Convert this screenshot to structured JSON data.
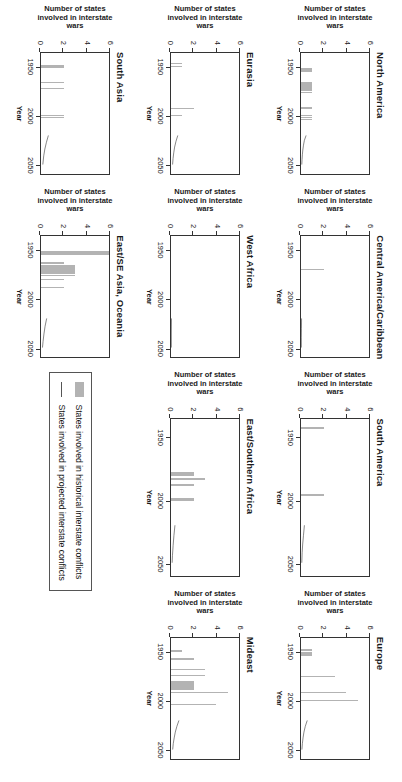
{
  "figure": {
    "rotation_degrees": 90,
    "panel_count": 11,
    "axis_titles": {
      "y": "Number of states involved in interstate wars",
      "x": "Year"
    },
    "y_ticks": [
      "0",
      "2",
      "4",
      "6"
    ],
    "x_ticks": [
      "1950",
      "2000",
      "2050"
    ],
    "colors": {
      "historical_bar": "#b3b3b3",
      "projected_line": "#555555",
      "axis": "#333333",
      "background": "#ffffff"
    }
  },
  "legend": {
    "items": [
      {
        "marker": "bar-swatch",
        "label": "States involved in historical interstate conflicts"
      },
      {
        "marker": "line-swatch",
        "label": "States involved in projected interstate conflicts"
      }
    ]
  },
  "chart_data": {
    "type": "bar",
    "xlabel": "Year",
    "ylabel": "Number of states involved in interstate wars",
    "xlim": [
      1935,
      2060
    ],
    "ylim": [
      0,
      6
    ],
    "xticks": [
      1950,
      2000,
      2050
    ],
    "yticks": [
      0,
      2,
      4,
      6
    ],
    "grid": false,
    "legend_position": "center-right",
    "series_names": [
      "States involved in historical interstate conflicts",
      "States involved in projected interstate conflicts"
    ],
    "panels": [
      {
        "name": "North America",
        "historical": [
          {
            "year": 1950,
            "value": 1
          },
          {
            "year": 1951,
            "value": 1
          },
          {
            "year": 1952,
            "value": 1
          },
          {
            "year": 1953,
            "value": 1
          },
          {
            "year": 1965,
            "value": 1
          },
          {
            "year": 1966,
            "value": 1
          },
          {
            "year": 1967,
            "value": 1
          },
          {
            "year": 1968,
            "value": 1
          },
          {
            "year": 1969,
            "value": 1
          },
          {
            "year": 1970,
            "value": 1
          },
          {
            "year": 1971,
            "value": 1
          },
          {
            "year": 1972,
            "value": 1
          },
          {
            "year": 1973,
            "value": 1
          },
          {
            "year": 1975,
            "value": 1
          },
          {
            "year": 1991,
            "value": 1
          },
          {
            "year": 1999,
            "value": 1
          },
          {
            "year": 2001,
            "value": 1
          },
          {
            "year": 2003,
            "value": 1
          }
        ],
        "projected": [
          {
            "year": 2020,
            "value": 0.45
          },
          {
            "year": 2025,
            "value": 0.3
          },
          {
            "year": 2030,
            "value": 0.22
          },
          {
            "year": 2035,
            "value": 0.16
          },
          {
            "year": 2040,
            "value": 0.12
          },
          {
            "year": 2045,
            "value": 0.09
          },
          {
            "year": 2050,
            "value": 0.07
          }
        ]
      },
      {
        "name": "Central America/Caribbean",
        "historical": [
          {
            "year": 1969,
            "value": 2
          }
        ],
        "projected": [
          {
            "year": 2020,
            "value": 0.05
          },
          {
            "year": 2030,
            "value": 0.04
          },
          {
            "year": 2040,
            "value": 0.03
          },
          {
            "year": 2050,
            "value": 0.03
          }
        ]
      },
      {
        "name": "South America",
        "historical": [
          {
            "year": 1941,
            "value": 2
          },
          {
            "year": 1995,
            "value": 2
          }
        ],
        "projected": [
          {
            "year": 2020,
            "value": 0.3
          },
          {
            "year": 2028,
            "value": 0.22
          },
          {
            "year": 2035,
            "value": 0.15
          },
          {
            "year": 2042,
            "value": 0.1
          },
          {
            "year": 2050,
            "value": 0.07
          }
        ]
      },
      {
        "name": "Europe",
        "historical": [
          {
            "year": 1947,
            "value": 1
          },
          {
            "year": 1950,
            "value": 1
          },
          {
            "year": 1951,
            "value": 1
          },
          {
            "year": 1952,
            "value": 1
          },
          {
            "year": 1953,
            "value": 1
          },
          {
            "year": 1974,
            "value": 3
          },
          {
            "year": 1991,
            "value": 4
          },
          {
            "year": 1999,
            "value": 5
          }
        ],
        "projected": [
          {
            "year": 2020,
            "value": 0.55
          },
          {
            "year": 2026,
            "value": 0.38
          },
          {
            "year": 2032,
            "value": 0.26
          },
          {
            "year": 2038,
            "value": 0.18
          },
          {
            "year": 2044,
            "value": 0.12
          },
          {
            "year": 2050,
            "value": 0.08
          }
        ]
      },
      {
        "name": "Eurasia",
        "historical": [
          {
            "year": 1945,
            "value": 1
          },
          {
            "year": 1948,
            "value": 1
          },
          {
            "year": 1992,
            "value": 2
          },
          {
            "year": 1999,
            "value": 1
          }
        ],
        "projected": [
          {
            "year": 2020,
            "value": 0.6
          },
          {
            "year": 2026,
            "value": 0.44
          },
          {
            "year": 2032,
            "value": 0.32
          },
          {
            "year": 2038,
            "value": 0.24
          },
          {
            "year": 2044,
            "value": 0.18
          },
          {
            "year": 2050,
            "value": 0.14
          }
        ]
      },
      {
        "name": "West Africa",
        "historical": [],
        "projected": [
          {
            "year": 2020,
            "value": 0.04
          },
          {
            "year": 2035,
            "value": 0.03
          },
          {
            "year": 2050,
            "value": 0.03
          }
        ]
      },
      {
        "name": "East/Southern Africa",
        "historical": [
          {
            "year": 1977,
            "value": 2
          },
          {
            "year": 1978,
            "value": 2
          },
          {
            "year": 1979,
            "value": 2
          },
          {
            "year": 1982,
            "value": 3
          },
          {
            "year": 1987,
            "value": 2
          },
          {
            "year": 1998,
            "value": 2
          },
          {
            "year": 1999,
            "value": 2
          }
        ],
        "projected": [
          {
            "year": 2020,
            "value": 0.35
          },
          {
            "year": 2028,
            "value": 0.26
          },
          {
            "year": 2036,
            "value": 0.19
          },
          {
            "year": 2044,
            "value": 0.13
          },
          {
            "year": 2050,
            "value": 0.1
          }
        ]
      },
      {
        "name": "Mideast",
        "historical": [
          {
            "year": 1948,
            "value": 1
          },
          {
            "year": 1956,
            "value": 2
          },
          {
            "year": 1957,
            "value": 2
          },
          {
            "year": 1967,
            "value": 3
          },
          {
            "year": 1973,
            "value": 3
          },
          {
            "year": 1980,
            "value": 2
          },
          {
            "year": 1981,
            "value": 2
          },
          {
            "year": 1982,
            "value": 2
          },
          {
            "year": 1983,
            "value": 2
          },
          {
            "year": 1984,
            "value": 2
          },
          {
            "year": 1985,
            "value": 2
          },
          {
            "year": 1986,
            "value": 2
          },
          {
            "year": 1987,
            "value": 2
          },
          {
            "year": 1988,
            "value": 2
          },
          {
            "year": 1991,
            "value": 5
          },
          {
            "year": 2003,
            "value": 4
          }
        ],
        "projected": [
          {
            "year": 2020,
            "value": 0.7
          },
          {
            "year": 2026,
            "value": 0.52
          },
          {
            "year": 2032,
            "value": 0.38
          },
          {
            "year": 2038,
            "value": 0.28
          },
          {
            "year": 2044,
            "value": 0.2
          },
          {
            "year": 2050,
            "value": 0.15
          }
        ]
      },
      {
        "name": "South Asia",
        "historical": [
          {
            "year": 1947,
            "value": 2
          },
          {
            "year": 1948,
            "value": 2
          },
          {
            "year": 1949,
            "value": 2
          },
          {
            "year": 1965,
            "value": 2
          },
          {
            "year": 1971,
            "value": 2
          },
          {
            "year": 1999,
            "value": 2
          },
          {
            "year": 2001,
            "value": 2
          }
        ],
        "projected": [
          {
            "year": 2020,
            "value": 0.65
          },
          {
            "year": 2027,
            "value": 0.48
          },
          {
            "year": 2034,
            "value": 0.34
          },
          {
            "year": 2041,
            "value": 0.24
          },
          {
            "year": 2050,
            "value": 0.16
          }
        ]
      },
      {
        "name": "East/SE Asia, Oceania",
        "historical": [
          {
            "year": 1950,
            "value": 6
          },
          {
            "year": 1951,
            "value": 6
          },
          {
            "year": 1952,
            "value": 6
          },
          {
            "year": 1953,
            "value": 6
          },
          {
            "year": 1962,
            "value": 2
          },
          {
            "year": 1965,
            "value": 3
          },
          {
            "year": 1966,
            "value": 3
          },
          {
            "year": 1967,
            "value": 3
          },
          {
            "year": 1968,
            "value": 3
          },
          {
            "year": 1969,
            "value": 3
          },
          {
            "year": 1970,
            "value": 3
          },
          {
            "year": 1971,
            "value": 3
          },
          {
            "year": 1972,
            "value": 3
          },
          {
            "year": 1973,
            "value": 3
          },
          {
            "year": 1975,
            "value": 3
          },
          {
            "year": 1979,
            "value": 2
          },
          {
            "year": 1987,
            "value": 2
          }
        ],
        "projected": [
          {
            "year": 2020,
            "value": 0.5
          },
          {
            "year": 2028,
            "value": 0.36
          },
          {
            "year": 2036,
            "value": 0.26
          },
          {
            "year": 2044,
            "value": 0.18
          },
          {
            "year": 2050,
            "value": 0.13
          }
        ]
      }
    ]
  },
  "panels_layout_order": [
    "North America",
    "Central America/Caribbean",
    "South America",
    "Europe",
    "Eurasia",
    "West Africa",
    "East/Southern Africa",
    "Mideast",
    "South Asia",
    "East/SE Asia, Oceania",
    "legend"
  ]
}
